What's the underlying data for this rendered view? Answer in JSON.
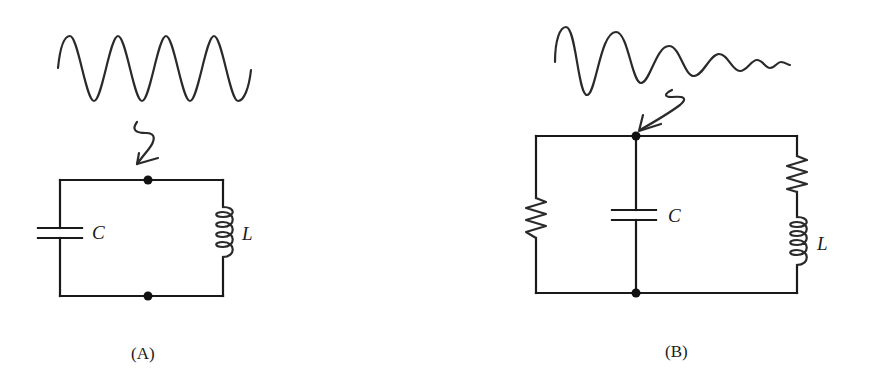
{
  "figure": {
    "panels": [
      {
        "id": "A",
        "caption": "(A)",
        "waveform": "undamped-sine",
        "components": [
          {
            "type": "capacitor",
            "label": "C"
          },
          {
            "type": "inductor",
            "label": "L"
          }
        ]
      },
      {
        "id": "B",
        "caption": "(B)",
        "waveform": "damped-sine",
        "components": [
          {
            "type": "resistor",
            "label": ""
          },
          {
            "type": "capacitor",
            "label": "C"
          },
          {
            "type": "resistor",
            "label": ""
          },
          {
            "type": "inductor",
            "label": "L"
          }
        ]
      }
    ]
  },
  "colors": {
    "ink": "#1a1a1a",
    "background": "#ffffff"
  }
}
